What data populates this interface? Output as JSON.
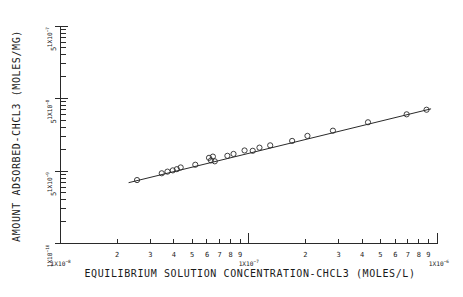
{
  "figure": {
    "background_color": "#ffffff",
    "ink_color": "#2a2a2a",
    "width": 463,
    "height": 297
  },
  "chart_data": {
    "type": "scatter",
    "title": "",
    "subtitle": "",
    "xlabel": "EQUILIBRIUM SOLUTION CONCENTRATION-CHCL3  (MOLES/L)",
    "ylabel": "AMOUNT ADSORBED-CHCL3  (MOLES/MG)",
    "xscale": "log",
    "yscale": "log",
    "xlim": [
      1e-08,
      1e-06
    ],
    "ylim": [
      1e-10,
      1e-07
    ],
    "grid": false,
    "legend": null,
    "marker_style": "open-circle",
    "x_decade_labels": [
      "1X10-8",
      "1X10-7",
      "1X10-6"
    ],
    "x_decade_values": [
      1e-08,
      1e-07,
      1e-06
    ],
    "x_minor_tick_labels": [
      "2",
      "3",
      "4",
      "5",
      "6",
      "7",
      "8",
      "9"
    ],
    "y_decade_labels": [
      "1X10-10",
      "1X10-9",
      "1X10-8",
      "1X10-7"
    ],
    "y_decade_values": [
      1e-10,
      1e-09,
      1e-08,
      1e-07
    ],
    "y_minor_tick_labels": [
      "5",
      "5",
      "5"
    ],
    "series": [
      {
        "name": "CHCL3 adsorption isotherm",
        "marker": "open-circle",
        "points": [
          {
            "x": 2.55e-08,
            "y": 7.5e-10
          },
          {
            "x": 3.45e-08,
            "y": 9.3e-10
          },
          {
            "x": 3.7e-08,
            "y": 9.8e-10
          },
          {
            "x": 3.95e-08,
            "y": 1.02e-09
          },
          {
            "x": 4.15e-08,
            "y": 1.06e-09
          },
          {
            "x": 4.35e-08,
            "y": 1.12e-09
          },
          {
            "x": 5.2e-08,
            "y": 1.22e-09
          },
          {
            "x": 6.15e-08,
            "y": 1.52e-09
          },
          {
            "x": 6.3e-08,
            "y": 1.4e-09
          },
          {
            "x": 6.45e-08,
            "y": 1.58e-09
          },
          {
            "x": 6.6e-08,
            "y": 1.36e-09
          },
          {
            "x": 7.7e-08,
            "y": 1.62e-09
          },
          {
            "x": 8.3e-08,
            "y": 1.72e-09
          },
          {
            "x": 9.5e-08,
            "y": 1.92e-09
          },
          {
            "x": 1.05e-07,
            "y": 1.9e-09
          },
          {
            "x": 1.14e-07,
            "y": 2.1e-09
          },
          {
            "x": 1.3e-07,
            "y": 2.26e-09
          },
          {
            "x": 1.7e-07,
            "y": 2.6e-09
          },
          {
            "x": 2.05e-07,
            "y": 3.05e-09
          },
          {
            "x": 2.8e-07,
            "y": 3.6e-09
          },
          {
            "x": 4.3e-07,
            "y": 4.7e-09
          },
          {
            "x": 6.9e-07,
            "y": 6.05e-09
          },
          {
            "x": 8.8e-07,
            "y": 7e-09
          }
        ]
      }
    ],
    "fit_line": {
      "name": "linear regression (log-log)",
      "x_start": 2.3e-08,
      "y_start": 6.9e-10,
      "x_end": 9.3e-07,
      "y_end": 7.2e-09
    }
  }
}
